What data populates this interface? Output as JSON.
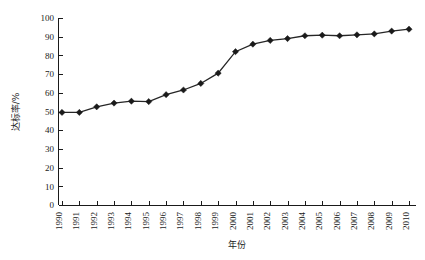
{
  "chart_data": {
    "type": "line",
    "title": "",
    "xlabel": "年份",
    "ylabel": "达标率/%",
    "xlim": [
      1990,
      2010
    ],
    "ylim": [
      0,
      100
    ],
    "ytick_step": 10,
    "grid": false,
    "legend": "none",
    "marker": "diamond",
    "categories": [
      "1990",
      "1991",
      "1992",
      "1993",
      "1994",
      "1995",
      "1996",
      "1997",
      "1998",
      "1999",
      "2000",
      "2001",
      "2002",
      "2003",
      "2004",
      "2005",
      "2006",
      "2007",
      "2008",
      "2009",
      "2010"
    ],
    "x": [
      1990,
      1991,
      1992,
      1993,
      1994,
      1995,
      1996,
      1997,
      1998,
      1999,
      2000,
      2001,
      2002,
      2003,
      2004,
      2005,
      2006,
      2007,
      2008,
      2009,
      2010
    ],
    "values": [
      49.5,
      49.5,
      52.5,
      54.5,
      55.5,
      55.3,
      59,
      61.5,
      65,
      70.5,
      82,
      86,
      88,
      89,
      90.5,
      90.8,
      90.5,
      91,
      91.5,
      93,
      94
    ],
    "ytick_labels": [
      "0",
      "10",
      "20",
      "30",
      "40",
      "50",
      "60",
      "70",
      "80",
      "90",
      "100"
    ],
    "series": [
      {
        "name": "达标率",
        "color": "#1a1a1a",
        "values": [
          49.5,
          49.5,
          52.5,
          54.5,
          55.5,
          55.3,
          59,
          61.5,
          65,
          70.5,
          82,
          86,
          88,
          89,
          90.5,
          90.8,
          90.5,
          91,
          91.5,
          93,
          94
        ]
      }
    ]
  },
  "axis": {
    "y_axis_name": "y-axis",
    "x_axis_name": "x-axis"
  }
}
